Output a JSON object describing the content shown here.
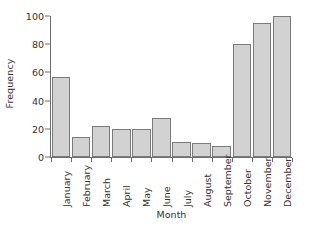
{
  "chart_data": {
    "type": "bar",
    "title": "",
    "xlabel": "Month",
    "ylabel": "Frequency",
    "categories": [
      "January",
      "February",
      "March",
      "April",
      "May",
      "June",
      "July",
      "August",
      "September",
      "October",
      "November",
      "December"
    ],
    "values": [
      57,
      14,
      22,
      20,
      20,
      28,
      11,
      10,
      8,
      80,
      95,
      100
    ],
    "ylim": [
      0,
      100
    ],
    "yticks": [
      0,
      20,
      40,
      60,
      80,
      100
    ],
    "ytick_labels": [
      "0",
      "20",
      "40",
      "60",
      "80",
      "100"
    ],
    "grid": false,
    "legend": false,
    "bar_fill_color": "#d2d2d2",
    "bar_edge_color": "#7b7b7b",
    "axis_color": "#6e6e6e",
    "text_color": "#333333",
    "background_color": "#ffffff"
  }
}
